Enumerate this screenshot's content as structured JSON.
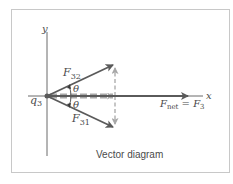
{
  "diagram": {
    "caption": "Vector diagram",
    "axes": {
      "x_label": "x",
      "y_label": "y"
    },
    "charge": {
      "name": "q",
      "subscript": "3"
    },
    "vectors": {
      "f32": {
        "name": "F",
        "subscript": "32"
      },
      "f31": {
        "name": "F",
        "subscript": "31"
      },
      "fnet": {
        "name": "F",
        "subscript": "net",
        "equals": " = F",
        "equals_subscript": "3"
      }
    },
    "angle_label": "θ",
    "colors": {
      "vector": "#5a5a5a",
      "axis": "#6a6a6a",
      "dashed_component": "#a8a8a8",
      "frame": "#c8c8c8",
      "text": "#4a4a4a"
    }
  }
}
